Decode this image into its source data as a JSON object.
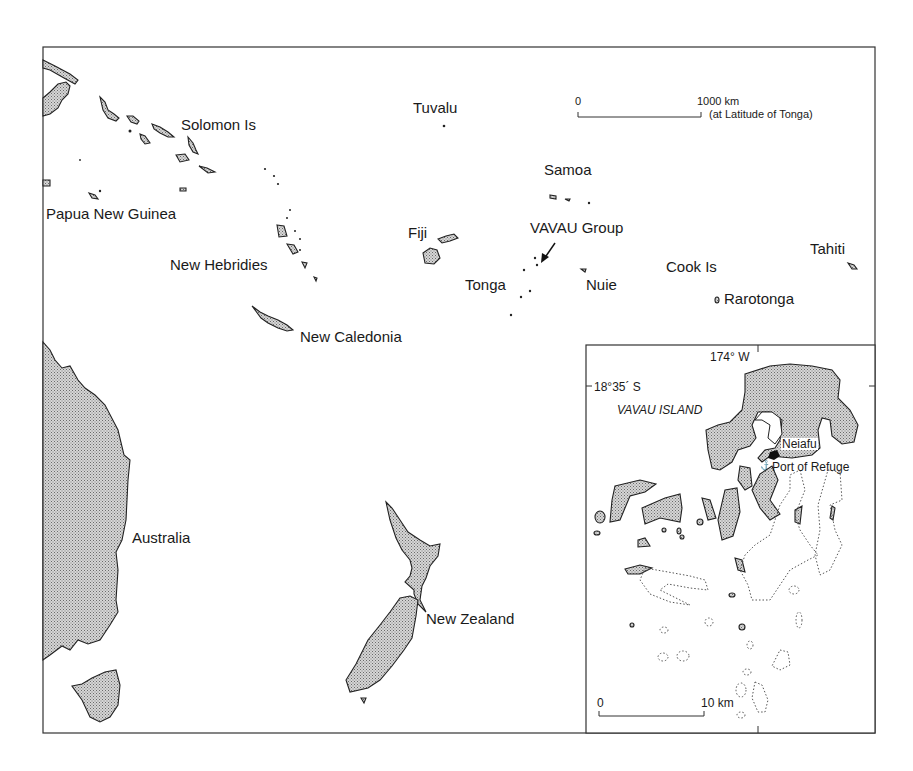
{
  "map": {
    "title": "South-West Pacific with inset of Vavau Group",
    "colors": {
      "land_fill": "#bdbdbd",
      "outline": "#222222",
      "background": "#ffffff"
    },
    "scale_bar": {
      "start": "0",
      "end": "1000 km",
      "note": "(at Latitude of Tonga)"
    },
    "labels": {
      "solomon": "Solomon Is",
      "tuvalu": "Tuvalu",
      "png": "Papua New Guinea",
      "samoa": "Samoa",
      "fiji": "Fiji",
      "vavau_group": "VAVAU Group",
      "new_hebridies": "New Hebridies",
      "tonga": "Tonga",
      "nuie": "Nuie",
      "cook": "Cook Is",
      "tahiti": "Tahiti",
      "rarotonga": "Rarotonga",
      "new_caledonia": "New Caledonia",
      "australia": "Australia",
      "new_zealand": "New Zealand"
    },
    "inset": {
      "longitude": "174° W",
      "latitude": "18°35´ S",
      "island": "VAVAU ISLAND",
      "town": "Neiafu",
      "harbour": "Port of Refuge",
      "scale_start": "0",
      "scale_end": "10 km"
    }
  }
}
